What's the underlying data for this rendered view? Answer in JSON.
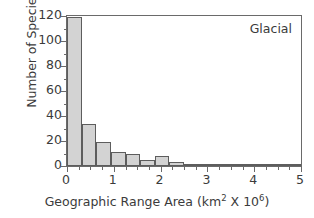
{
  "chart_data": {
    "type": "bar",
    "title": "",
    "annotation": "Glacial",
    "xlabel_parts": {
      "main": "Geographic Range Area (km",
      "sup1": "2",
      "mid": " X 10",
      "sup2": "6",
      "end": ")"
    },
    "xlabel": "Geographic Range Area (km2 X 106)",
    "ylabel": "Number of Species",
    "xlim": [
      0,
      5
    ],
    "ylim": [
      0,
      120
    ],
    "grid": false,
    "legend": "none",
    "bin_width": 0.3125,
    "x_major_ticks": [
      0,
      1,
      2,
      3,
      4,
      5
    ],
    "x_minor_ticks": [
      0.25,
      0.5,
      0.75,
      1.25,
      1.5,
      1.75,
      2.25,
      2.5,
      2.75,
      3.25,
      3.5,
      3.75,
      4.25,
      4.5,
      4.75
    ],
    "y_major_ticks": [
      0,
      20,
      40,
      60,
      80,
      100,
      120
    ],
    "y_minor_ticks": [
      10,
      30,
      50,
      70,
      90,
      110
    ],
    "x_tick_labels": [
      "0",
      "1",
      "2",
      "3",
      "4",
      "5"
    ],
    "y_tick_labels": [
      "0",
      "20",
      "40",
      "60",
      "80",
      "100",
      "120"
    ],
    "bin_starts": [
      0.0,
      0.3125,
      0.625,
      0.9375,
      1.25,
      1.5625,
      1.875,
      2.1875,
      2.5,
      2.8125,
      3.125,
      3.4375,
      3.75,
      4.0625,
      4.375,
      4.6875
    ],
    "categories": [
      "0-0.31",
      "0.31-0.63",
      "0.63-0.94",
      "0.94-1.25",
      "1.25-1.56",
      "1.56-1.88",
      "1.88-2.19",
      "2.19-2.5",
      "2.5-2.81",
      "2.81-3.13",
      "3.13-3.44",
      "3.44-3.75",
      "3.75-4.06",
      "4.06-4.38",
      "4.38-4.69",
      "4.69-5.0"
    ],
    "values": [
      119,
      34,
      19,
      11,
      10,
      5,
      8,
      3.5,
      1,
      1,
      1,
      1,
      0.5,
      2,
      1,
      0.5
    ],
    "bar_fill_color": "#d3d3d3",
    "bar_edge_color": "#5d5d5d",
    "axis_color": "#6a6a6a",
    "text_color": "#3b3b3b",
    "background_color": "#ffffff"
  }
}
